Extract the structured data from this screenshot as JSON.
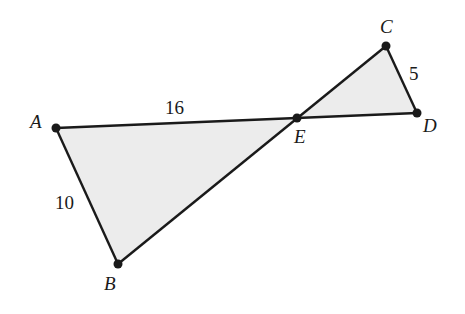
{
  "diagram": {
    "type": "geometry",
    "fill_color": "#ececec",
    "stroke_color": "#1a1a1a",
    "points": {
      "A": {
        "label": "A",
        "x": 56,
        "y": 128
      },
      "B": {
        "label": "B",
        "x": 118,
        "y": 264
      },
      "C": {
        "label": "C",
        "x": 386,
        "y": 46
      },
      "D": {
        "label": "D",
        "x": 417,
        "y": 113
      },
      "E": {
        "label": "E",
        "x": 297,
        "y": 118
      }
    },
    "triangles": [
      {
        "name": "ABE",
        "vertices": [
          "A",
          "B",
          "E"
        ]
      },
      {
        "name": "CDE",
        "vertices": [
          "C",
          "D",
          "E"
        ]
      }
    ],
    "segments": [
      {
        "from": "A",
        "to": "D"
      },
      {
        "from": "B",
        "to": "C"
      },
      {
        "from": "A",
        "to": "B"
      },
      {
        "from": "C",
        "to": "D"
      }
    ],
    "measurements": {
      "AE": "16",
      "AB": "10",
      "CD": "5"
    }
  }
}
